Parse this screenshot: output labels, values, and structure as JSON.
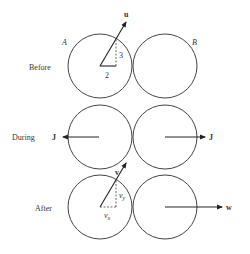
{
  "diagram": {
    "labels": {
      "ball_a": "A",
      "ball_b": "B",
      "rows": {
        "before": "Before",
        "during": "During",
        "after": "After"
      }
    },
    "before": {
      "velocity_label": "u",
      "component_x": "2",
      "component_y": "3"
    },
    "during": {
      "impulse_left": "J",
      "impulse_right": "J"
    },
    "after": {
      "velocity_a_label": "v",
      "component_x": "v",
      "component_x_sub": "x",
      "component_y": "v",
      "component_y_sub": "y",
      "velocity_b_label": "w"
    }
  }
}
